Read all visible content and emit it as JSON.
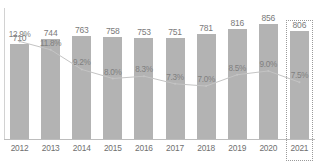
{
  "chart_data": {
    "type": "bar",
    "title": "",
    "subtitle": "",
    "xlabel": "",
    "ylabel": "",
    "grid": false,
    "legend": "none",
    "categories": [
      "2012",
      "2013",
      "2014",
      "2015",
      "2016",
      "2017",
      "2018",
      "2019",
      "2020",
      "2021"
    ],
    "series": [
      {
        "name": "value",
        "type": "bar",
        "values": [
          710,
          744,
          763,
          758,
          753,
          751,
          781,
          816,
          856,
          806
        ],
        "labels": [
          "710",
          "744",
          "763",
          "758",
          "753",
          "751",
          "781",
          "816",
          "856",
          "806"
        ],
        "color": "#b3b3b3",
        "ylim": [
          0,
          900
        ]
      },
      {
        "name": "rate",
        "type": "line",
        "values": [
          12.9,
          11.8,
          9.2,
          8.0,
          8.3,
          7.3,
          7.0,
          8.5,
          9.0,
          7.5
        ],
        "labels": [
          "12.9%",
          "11.8%",
          "9.2%",
          "8.0%",
          "8.3%",
          "7.3%",
          "7.0%",
          "8.5%",
          "9.0%",
          "7.5%"
        ],
        "color": "#c4c4c4",
        "ylim": [
          0,
          16
        ]
      }
    ],
    "highlight": {
      "category": "2021",
      "style": "dotted-box",
      "color": "#9a9a9a"
    },
    "colors": {
      "bar": "#b3b3b3",
      "line": "#c4c4c4",
      "axis": "#bdbdbd",
      "text": "#6f6f6f",
      "background": "#ffffff"
    }
  }
}
